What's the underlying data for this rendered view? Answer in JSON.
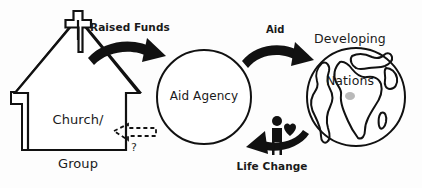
{
  "diagram": {
    "background_color": "#fdfdfd",
    "stroke_color": "#111111",
    "nodes": {
      "church": {
        "label_line1": "Church/",
        "label_line2": "Group",
        "label": "Church/ Group",
        "shape": "church-house-with-cross",
        "icon": "cross-icon"
      },
      "agency": {
        "label": "Aid Agency",
        "shape": "circle"
      },
      "nations": {
        "label_line1": "Developing",
        "label_line2": "Nations",
        "label": "Developing Nations",
        "shape": "globe",
        "icon": "globe-icon"
      },
      "person": {
        "label": "",
        "icon": "person-with-heart-icon"
      }
    },
    "arrows": {
      "raised_funds": {
        "label": "Raised Funds",
        "style": "solid",
        "from": "church",
        "to": "agency",
        "direction": "right"
      },
      "aid": {
        "label": "Aid",
        "style": "solid",
        "from": "agency",
        "to": "nations",
        "direction": "right"
      },
      "life_change": {
        "label": "Life Change",
        "style": "solid",
        "from": "nations",
        "to": "agency",
        "direction": "left"
      },
      "unknown_feedback": {
        "label": "?",
        "style": "dashed",
        "from": "agency",
        "to": "church",
        "direction": "left"
      }
    }
  }
}
